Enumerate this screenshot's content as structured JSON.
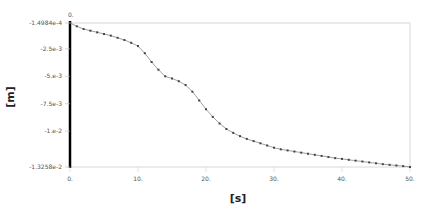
{
  "chart_data": {
    "type": "line",
    "title": "",
    "xlabel": "[s]",
    "ylabel": "[m]",
    "xlim": [
      0,
      50
    ],
    "ylim": [
      -0.013258,
      -0.00014984
    ],
    "grid": false,
    "legend": null,
    "x_ticks": [
      "0.",
      "10.",
      "20.",
      "30.",
      "40.",
      "50."
    ],
    "y_ticks": [
      "-1.4984e-4",
      "-2.5e-3",
      "-5.e-3",
      "-7.5e-3",
      "-1.e-2",
      "-1.3258e-2"
    ],
    "top_origin_label": "0.",
    "x": [
      0,
      1,
      2,
      3,
      4,
      5,
      6,
      7,
      8,
      9,
      10,
      11,
      12,
      13,
      14,
      15,
      16,
      17,
      18,
      19,
      20,
      21,
      22,
      23,
      24,
      25,
      26,
      27,
      28,
      29,
      30,
      31,
      32,
      33,
      34,
      35,
      36,
      37,
      38,
      39,
      40,
      41,
      42,
      43,
      44,
      45,
      46,
      47,
      48,
      49,
      50
    ],
    "series": [
      {
        "name": "displacement",
        "color": "#888888",
        "marker_color": "#444444",
        "values": [
          -0.00015,
          -0.00045,
          -0.0007,
          -0.00085,
          -0.001,
          -0.00115,
          -0.0013,
          -0.0015,
          -0.0017,
          -0.00195,
          -0.00225,
          -0.0029,
          -0.0037,
          -0.0044,
          -0.005,
          -0.0052,
          -0.00545,
          -0.0058,
          -0.0064,
          -0.0072,
          -0.008,
          -0.0087,
          -0.0093,
          -0.0098,
          -0.01015,
          -0.01045,
          -0.0107,
          -0.0109,
          -0.0111,
          -0.0113,
          -0.0115,
          -0.01165,
          -0.01175,
          -0.01185,
          -0.01195,
          -0.01205,
          -0.01215,
          -0.01225,
          -0.01235,
          -0.01245,
          -0.01252,
          -0.0126,
          -0.01268,
          -0.01276,
          -0.01284,
          -0.01292,
          -0.013,
          -0.01306,
          -0.01312,
          -0.01318,
          -0.01326
        ]
      }
    ]
  }
}
